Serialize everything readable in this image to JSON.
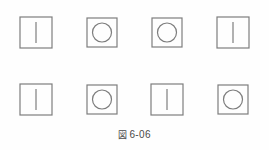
{
  "figure": {
    "caption_glyph": "図",
    "caption_number": "6-06",
    "caption_full": "図 6-06",
    "stroke_color": "#7d7d7d",
    "background_color": "#fefefe",
    "rows": [
      {
        "row_label": "row-1",
        "cells": [
          {
            "shape": "square-with-vertical-line",
            "inner": "vertical-line"
          },
          {
            "shape": "square-with-circle",
            "inner": "circle"
          },
          {
            "shape": "square-with-circle",
            "inner": "circle"
          },
          {
            "shape": "square-with-vertical-line",
            "inner": "vertical-line"
          }
        ]
      },
      {
        "row_label": "row-2",
        "cells": [
          {
            "shape": "square-with-vertical-line",
            "inner": "vertical-line"
          },
          {
            "shape": "square-with-circle",
            "inner": "circle"
          },
          {
            "shape": "square-with-vertical-line",
            "inner": "vertical-line"
          },
          {
            "shape": "square-with-circle",
            "inner": "circle"
          }
        ]
      }
    ]
  }
}
